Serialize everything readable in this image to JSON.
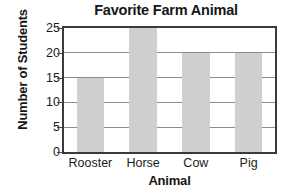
{
  "chart_data": {
    "type": "bar",
    "title": "Favorite Farm Animal",
    "xlabel": "Animal",
    "ylabel": "Number of Students",
    "categories": [
      "Rooster",
      "Horse",
      "Cow",
      "Pig"
    ],
    "values": [
      15,
      25,
      20,
      20
    ],
    "ylim": [
      0,
      25
    ],
    "yticks": [
      0,
      5,
      10,
      15,
      20,
      25
    ],
    "ytick_labels": [
      "0",
      "5",
      "10",
      "15",
      "20",
      "25"
    ],
    "grid": "horizontal",
    "legend": "none",
    "colors": {
      "bar_fill": "#cfcfcf",
      "axis": "#3a3a3a",
      "gridline": "#8c8c8c",
      "text": "#161616",
      "background": "#ffffff"
    }
  }
}
